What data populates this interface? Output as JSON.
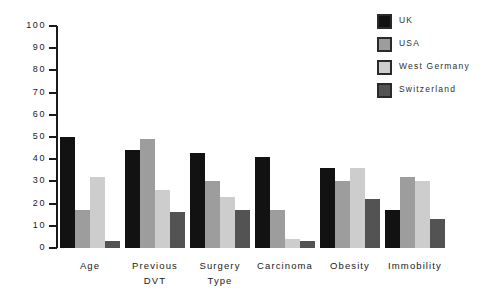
{
  "chart_data": {
    "type": "bar",
    "title": "",
    "subtitle": "",
    "xlabel": "",
    "ylabel": "",
    "ylim": [
      0,
      100
    ],
    "yticks": [
      0,
      10,
      20,
      30,
      40,
      50,
      60,
      70,
      80,
      90,
      100
    ],
    "ytick_labels": [
      "0",
      "10",
      "20",
      "30",
      "40",
      "50",
      "60",
      "70",
      "80",
      "90",
      "100"
    ],
    "grid": false,
    "legend_position": "top-right",
    "categories": [
      "Age",
      "Previous DVT",
      "Surgery Type",
      "Carcinoma",
      "Obesity",
      "Immobility"
    ],
    "category_lines": [
      [
        "Age"
      ],
      [
        "Previous",
        "DVT"
      ],
      [
        "Surgery",
        "Type"
      ],
      [
        "Carcinoma"
      ],
      [
        "Obesity"
      ],
      [
        "Immobility"
      ]
    ],
    "series": [
      {
        "name": "UK",
        "color": "#121212",
        "values": [
          50,
          44,
          43,
          41,
          36,
          17
        ]
      },
      {
        "name": "USA",
        "color": "#9d9d9d",
        "values": [
          17,
          49,
          30,
          17,
          30,
          32
        ]
      },
      {
        "name": "West Germany",
        "color": "#cdcdcd",
        "values": [
          32,
          26,
          23,
          4,
          36,
          30
        ]
      },
      {
        "name": "Switzerland",
        "color": "#535353",
        "values": [
          3,
          16,
          17,
          3,
          22,
          13
        ]
      }
    ]
  },
  "legend": {
    "items": [
      {
        "label": "UK"
      },
      {
        "label": "USA"
      },
      {
        "label": "West Germany"
      },
      {
        "label": "Switzerland"
      }
    ]
  }
}
